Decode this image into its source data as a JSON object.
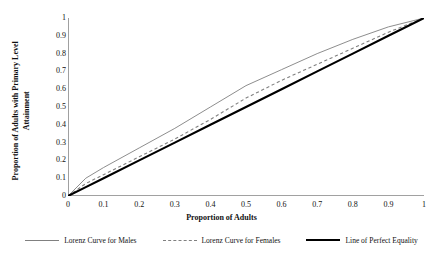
{
  "chart_data": {
    "type": "line",
    "title": "",
    "xlabel": "Proportion of Adults",
    "ylabel": "Proportion of Adults with Primary Level Attainment",
    "ylabel_line1": "Proportion of Adults with Primary Level",
    "ylabel_line2": "Attainment",
    "xlim": [
      0,
      1
    ],
    "ylim": [
      0,
      1
    ],
    "grid": false,
    "legend_position": "bottom",
    "xticks": [
      "0",
      "0.1",
      "0.2",
      "0.3",
      "0.4",
      "0.5",
      "0.6",
      "0.7",
      "0.8",
      "0.9",
      "1"
    ],
    "yticks": [
      "0",
      "0.1",
      "0.2",
      "0.3",
      "0.4",
      "0.5",
      "0.6",
      "0.7",
      "0.8",
      "0.9",
      "1"
    ],
    "x": [
      0,
      0.05,
      0.1,
      0.2,
      0.3,
      0.4,
      0.5,
      0.6,
      0.7,
      0.8,
      0.9,
      1
    ],
    "series": [
      {
        "name": "Lorenz Curve for Males",
        "style": "solid-thin",
        "color": "#808080",
        "values": [
          0,
          0.1,
          0.16,
          0.27,
          0.38,
          0.5,
          0.62,
          0.71,
          0.8,
          0.88,
          0.95,
          1
        ]
      },
      {
        "name": "Lorenz Curve for Females",
        "style": "dashed",
        "color": "#808080",
        "values": [
          0,
          0.07,
          0.12,
          0.22,
          0.32,
          0.43,
          0.55,
          0.65,
          0.74,
          0.83,
          0.92,
          1
        ]
      },
      {
        "name": "Line of Perfect Equality",
        "style": "solid-thick",
        "color": "#000000",
        "values": [
          0,
          0.05,
          0.1,
          0.2,
          0.3,
          0.4,
          0.5,
          0.6,
          0.7,
          0.8,
          0.9,
          1
        ]
      }
    ]
  },
  "axis": {
    "x_title": "Proportion of Adults",
    "y_title_line1": "Proportion of Adults with Primary Level",
    "y_title_line2": "Attainment"
  },
  "legend": {
    "items": [
      {
        "label": "Lorenz Curve for Males",
        "swatch": "solid-thin-line-icon"
      },
      {
        "label": "Lorenz Curve for Females",
        "swatch": "dashed-line-icon"
      },
      {
        "label": "Line of Perfect Equality",
        "swatch": "solid-thick-line-icon"
      }
    ]
  },
  "colors": {
    "curve_gray": "#808080",
    "equality_black": "#000000",
    "text": "#111111",
    "background": "#ffffff"
  }
}
